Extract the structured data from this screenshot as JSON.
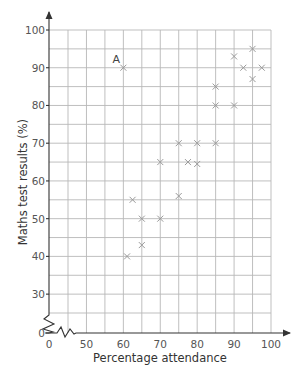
{
  "chart_data": {
    "type": "scatter",
    "title": "",
    "xlabel": "Percentage attendance",
    "ylabel": "Maths test results (%)",
    "xlim": [
      45,
      100
    ],
    "ylim": [
      25,
      100
    ],
    "x_axis_break": true,
    "y_axis_break": true,
    "grid": true,
    "x_ticks": [
      0,
      50,
      60,
      70,
      80,
      90,
      100
    ],
    "y_ticks": [
      0,
      30,
      40,
      50,
      60,
      70,
      80,
      90,
      100
    ],
    "x_tick_labels": [
      "0",
      "50",
      "60",
      "70",
      "80",
      "90",
      "100"
    ],
    "y_tick_labels": [
      "0",
      "30",
      "40",
      "50",
      "60",
      "70",
      "80",
      "90",
      "100"
    ],
    "marker": "x",
    "points": [
      {
        "x": 60,
        "y": 90,
        "label": "A"
      },
      {
        "x": 61,
        "y": 40
      },
      {
        "x": 62.5,
        "y": 55
      },
      {
        "x": 65,
        "y": 50
      },
      {
        "x": 65,
        "y": 43
      },
      {
        "x": 70,
        "y": 50
      },
      {
        "x": 70,
        "y": 65
      },
      {
        "x": 75,
        "y": 56
      },
      {
        "x": 75,
        "y": 70
      },
      {
        "x": 77.5,
        "y": 65
      },
      {
        "x": 80,
        "y": 70
      },
      {
        "x": 80,
        "y": 64.5
      },
      {
        "x": 85,
        "y": 70
      },
      {
        "x": 85,
        "y": 80
      },
      {
        "x": 85,
        "y": 85
      },
      {
        "x": 90,
        "y": 80
      },
      {
        "x": 90,
        "y": 93
      },
      {
        "x": 92.5,
        "y": 90
      },
      {
        "x": 95,
        "y": 95
      },
      {
        "x": 95,
        "y": 87
      },
      {
        "x": 97.5,
        "y": 90
      }
    ],
    "annotations": [
      {
        "text": "A",
        "x": 60,
        "y": 90
      }
    ]
  }
}
